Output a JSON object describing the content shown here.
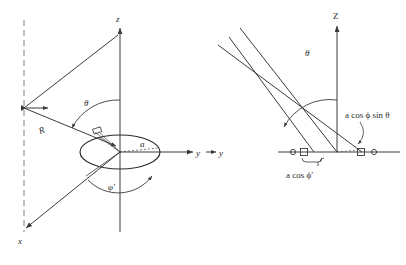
{
  "figure": {
    "caption_fragment": "",
    "background_color": "#ffffff",
    "stroke_color": "#3a3a3a"
  },
  "left_diagram": {
    "name": "spherical-coordinate-geometry",
    "axes": [
      {
        "id": "z",
        "label": "z",
        "direction": "up"
      },
      {
        "id": "y",
        "label": "y",
        "direction": "right"
      },
      {
        "id": "x",
        "label": "x",
        "direction": "down-left"
      }
    ],
    "angles": [
      {
        "id": "theta",
        "label": "θ",
        "description": "polar angle from z axis"
      },
      {
        "id": "phi-prime",
        "label": "φ′",
        "description": "azimuthal angle in xy plane"
      }
    ],
    "lengths": [
      {
        "id": "R",
        "label": "R",
        "description": "distance to far field point"
      },
      {
        "id": "a",
        "label": "a",
        "description": "radius of circular aperture"
      }
    ],
    "shapes": [
      {
        "id": "aperture-ellipse",
        "description": "circular aperture drawn in perspective as ellipse"
      },
      {
        "id": "reference-dashed-line",
        "description": "vertical dashed reference line at left"
      }
    ]
  },
  "right_diagram": {
    "name": "path-difference-geometry",
    "axes": [
      {
        "id": "Z",
        "label": "Z",
        "direction": "up"
      },
      {
        "id": "y",
        "label": "y",
        "direction": "right"
      }
    ],
    "angles": [
      {
        "id": "theta",
        "label": "θ",
        "description": "ray inclination from Z axis"
      }
    ],
    "annotations": [
      {
        "id": "path-difference",
        "label": "a cos ϕ sin θ"
      },
      {
        "id": "projected-offset",
        "label": "a cos ϕ′"
      }
    ],
    "markers": [
      {
        "id": "marker-circle-left",
        "shape": "circle"
      },
      {
        "id": "marker-square-left",
        "shape": "square"
      },
      {
        "id": "marker-square-right",
        "shape": "square"
      },
      {
        "id": "marker-circle-right",
        "shape": "circle"
      }
    ],
    "rays": {
      "count": 3,
      "description": "three parallel rays inclined at angle theta"
    }
  }
}
